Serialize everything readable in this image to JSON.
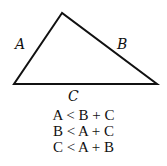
{
  "diagram": {
    "type": "triangle",
    "vertices": {
      "top": [
        62,
        13
      ],
      "left": [
        14,
        84
      ],
      "right": [
        157,
        84
      ]
    },
    "sides": [
      {
        "name": "A",
        "label": "A",
        "from": "left",
        "to": "top"
      },
      {
        "name": "B",
        "label": "B",
        "from": "top",
        "to": "right"
      },
      {
        "name": "C",
        "label": "C",
        "from": "left",
        "to": "right"
      }
    ],
    "inequalities": [
      "A < B + C",
      "B < A + C",
      "C < A + B"
    ]
  }
}
